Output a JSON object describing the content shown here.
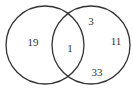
{
  "diagram": {
    "type": "venn",
    "stroke_color": "#333333",
    "background": "#ffffff",
    "sets": [
      {
        "name": "left-set",
        "cx": 45,
        "cy": 45,
        "r": 39
      },
      {
        "name": "right-set",
        "cx": 91,
        "cy": 45,
        "r": 39
      }
    ],
    "regions": {
      "left_only": {
        "label": "19",
        "x": 33,
        "y": 46
      },
      "intersection": {
        "label": "1",
        "x": 70,
        "y": 52
      },
      "right_top": {
        "label": "3",
        "x": 91,
        "y": 25
      },
      "right_side": {
        "label": "11",
        "x": 116,
        "y": 45
      },
      "right_bottom": {
        "label": "33",
        "x": 97,
        "y": 76
      }
    }
  }
}
